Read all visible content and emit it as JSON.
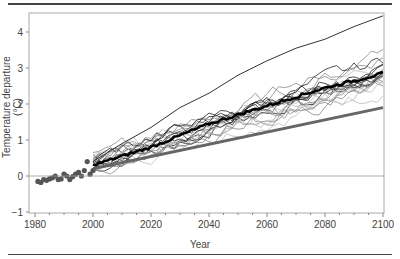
{
  "chart_data": {
    "type": "line",
    "title": "",
    "xlabel": "Year",
    "ylabel": "Temperature departure (°C)",
    "xlim": [
      1980,
      2100
    ],
    "ylim": [
      -1,
      4.5
    ],
    "x_ticks": [
      1980,
      2000,
      2020,
      2040,
      2060,
      2080,
      2100
    ],
    "y_ticks": [
      -1,
      0,
      1,
      2,
      3,
      4
    ],
    "grid": false,
    "legend": null,
    "reference_line": {
      "y": 0,
      "color": "#999999"
    },
    "observations": {
      "name": "Observed",
      "style": "dots",
      "color": "#555555",
      "x": [
        1981,
        1982,
        1983,
        1984,
        1985,
        1986,
        1987,
        1988,
        1989,
        1990,
        1991,
        1992,
        1993,
        1994,
        1995,
        1996,
        1997,
        1998,
        1999,
        2000
      ],
      "y": [
        -0.15,
        -0.18,
        -0.1,
        -0.12,
        -0.08,
        -0.05,
        0.0,
        -0.1,
        -0.08,
        0.05,
        0.0,
        -0.1,
        -0.02,
        0.05,
        0.1,
        0.0,
        0.15,
        0.4,
        0.05,
        0.15
      ]
    },
    "series": [
      {
        "name": "Model mean",
        "color": "#000000",
        "width": 2.5,
        "x": [
          2000,
          2020,
          2040,
          2060,
          2080,
          2100
        ],
        "y": [
          0.3,
          0.8,
          1.45,
          1.95,
          2.45,
          2.85
        ]
      },
      {
        "name": "Linear trend",
        "color": "#666666",
        "width": 3,
        "x": [
          2000,
          2100
        ],
        "y": [
          0.2,
          1.9
        ]
      },
      {
        "name": "High model",
        "color": "#333333",
        "width": 1,
        "x": [
          2000,
          2010,
          2020,
          2030,
          2040,
          2050,
          2060,
          2070,
          2080,
          2090,
          2100
        ],
        "y": [
          0.4,
          0.9,
          1.35,
          1.9,
          2.3,
          2.8,
          3.2,
          3.55,
          3.8,
          4.15,
          4.45
        ]
      }
    ],
    "ensemble_spread": {
      "count": 20,
      "x": [
        2000,
        2100
      ],
      "low": [
        0.2,
        2.2
      ],
      "high": [
        0.5,
        3.6
      ],
      "colors": [
        "#222222",
        "#888888",
        "#bbbbbb"
      ]
    }
  },
  "labels": {
    "ylabel": "Temperature departure (°C)",
    "xlabel": "Year"
  }
}
